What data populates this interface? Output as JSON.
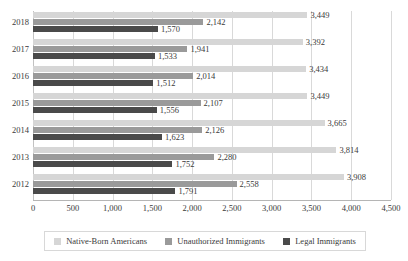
{
  "chart_data": {
    "type": "bar",
    "orientation": "horizontal",
    "title": "",
    "subtitle": "",
    "xlabel": "",
    "ylabel": "",
    "xlim": [
      0,
      4500
    ],
    "xticks": [
      "0",
      "500",
      "1,000",
      "1,500",
      "2,000",
      "2,500",
      "3,000",
      "3,500",
      "4,000",
      "4,500"
    ],
    "xtick_values": [
      0,
      500,
      1000,
      1500,
      2000,
      2500,
      3000,
      3500,
      4000,
      4500
    ],
    "grid": "vertical",
    "legend_position": "bottom",
    "categories": [
      "2018",
      "2017",
      "2016",
      "2015",
      "2014",
      "2013",
      "2012"
    ],
    "series": [
      {
        "name": "Native-Born Americans",
        "color": "#d6d6d6",
        "values": [
          3449,
          3392,
          3434,
          3449,
          3665,
          3814,
          3908
        ],
        "labels": [
          "3,449",
          "3,392",
          "3,434",
          "3,449",
          "3,665",
          "3,814",
          "3,908"
        ]
      },
      {
        "name": "Unauthorized Immigrants",
        "color": "#9a9a9a",
        "values": [
          2142,
          1941,
          2014,
          2107,
          2126,
          2280,
          2558
        ],
        "labels": [
          "2,142",
          "1,941",
          "2,014",
          "2,107",
          "2,126",
          "2,280",
          "2,558"
        ]
      },
      {
        "name": "Legal Immigrants",
        "color": "#4a4a4a",
        "values": [
          1570,
          1533,
          1512,
          1556,
          1623,
          1752,
          1791
        ],
        "labels": [
          "1,570",
          "1,533",
          "1,512",
          "1,556",
          "1,623",
          "1,752",
          "1,791"
        ]
      }
    ]
  },
  "legend": {
    "entries": [
      {
        "label": "Native-Born Americans",
        "color": "#d6d6d6"
      },
      {
        "label": "Unauthorized Immigrants",
        "color": "#9a9a9a"
      },
      {
        "label": "Legal Immigrants",
        "color": "#4a4a4a"
      }
    ]
  }
}
